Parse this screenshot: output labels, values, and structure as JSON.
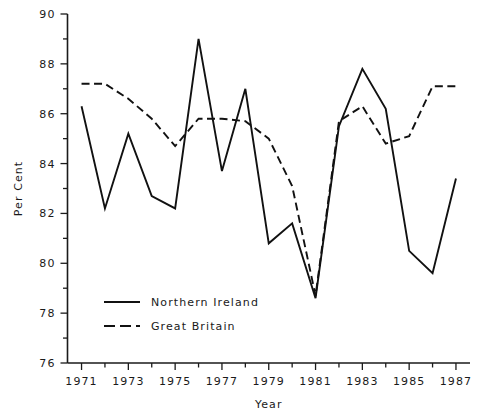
{
  "chart_data": {
    "type": "line",
    "title": "",
    "xlabel": "Year",
    "ylabel": "Per Cent",
    "xlim": [
      1970.4,
      1987.6
    ],
    "ylim": [
      76,
      90
    ],
    "grid": false,
    "legend_position": "lower-left-inside",
    "x": [
      1971,
      1972,
      1973,
      1974,
      1975,
      1976,
      1977,
      1978,
      1979,
      1980,
      1981,
      1982,
      1983,
      1984,
      1985,
      1986,
      1987
    ],
    "xtick_labels": [
      "1971",
      "1973",
      "1975",
      "1977",
      "1979",
      "1981",
      "1983",
      "1985",
      "1987"
    ],
    "xtick_values": [
      1971,
      1973,
      1975,
      1977,
      1979,
      1981,
      1983,
      1985,
      1987
    ],
    "xtick_minor_values": [
      1972,
      1974,
      1976,
      1978,
      1980,
      1982,
      1984,
      1986
    ],
    "ytick_labels": [
      "76",
      "78",
      "80",
      "82",
      "84",
      "86",
      "88",
      "90"
    ],
    "ytick_values": [
      76,
      78,
      80,
      82,
      84,
      86,
      88,
      90
    ],
    "ytick_minor_values": [
      77,
      79,
      81,
      83,
      85,
      87,
      89
    ],
    "series": [
      {
        "name": "Northern Ireland",
        "style": "solid",
        "color": "#111111",
        "values": [
          86.3,
          82.2,
          85.2,
          82.7,
          82.2,
          89.0,
          83.7,
          87.0,
          80.8,
          81.6,
          78.6,
          85.5,
          87.8,
          86.2,
          80.5,
          79.6,
          83.4
        ]
      },
      {
        "name": "Great Britain",
        "style": "dashed",
        "color": "#111111",
        "values": [
          87.2,
          87.2,
          86.6,
          85.8,
          84.7,
          85.8,
          85.8,
          85.7,
          85.0,
          83.1,
          78.7,
          85.7,
          86.3,
          84.8,
          85.1,
          87.1,
          87.1
        ]
      }
    ]
  },
  "legend": {
    "entries": [
      {
        "label": "Northern Ireland",
        "style": "solid"
      },
      {
        "label": "Great Britain",
        "style": "dashed"
      }
    ]
  }
}
